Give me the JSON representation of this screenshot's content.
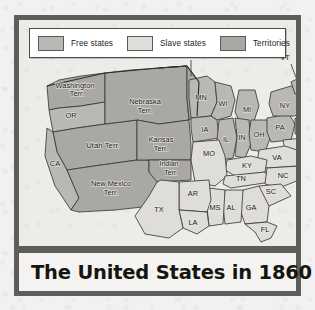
{
  "figure": {
    "title": "The United States in 1860",
    "legend": {
      "items": [
        {
          "label": "Free states",
          "color": "#b9b8b4",
          "key": "free"
        },
        {
          "label": "Slave states",
          "color": "#dedddA",
          "key": "slave"
        },
        {
          "label": "Territories",
          "color": "#a9a8a4",
          "key": "territory"
        }
      ]
    },
    "map": {
      "regions": [
        {
          "id": "washington-terr",
          "label": "Washington\nTerr.",
          "category": "territory"
        },
        {
          "id": "oregon",
          "label": "OR",
          "category": "free"
        },
        {
          "id": "california",
          "label": "CA",
          "category": "free"
        },
        {
          "id": "utah-terr",
          "label": "Utah Terr.",
          "category": "territory"
        },
        {
          "id": "new-mexico-terr",
          "label": "New Mexico\nTerr.",
          "category": "territory"
        },
        {
          "id": "nebraska-terr",
          "label": "Nebraska\nTerr.",
          "category": "territory"
        },
        {
          "id": "unorganized-terr",
          "label": "Unorganized\nTerr.",
          "category": "territory"
        },
        {
          "id": "kansas-terr",
          "label": "Kansas\nTerr.",
          "category": "territory"
        },
        {
          "id": "indian-terr",
          "label": "Indian\nTerr.",
          "category": "territory"
        },
        {
          "id": "minnesota",
          "label": "MN",
          "category": "free"
        },
        {
          "id": "wisconsin",
          "label": "WI",
          "category": "free"
        },
        {
          "id": "michigan",
          "label": "MI",
          "category": "free"
        },
        {
          "id": "iowa",
          "label": "IA",
          "category": "free"
        },
        {
          "id": "illinois",
          "label": "IL",
          "category": "free"
        },
        {
          "id": "indiana",
          "label": "IN",
          "category": "free"
        },
        {
          "id": "ohio",
          "label": "OH",
          "category": "free"
        },
        {
          "id": "pennsylvania",
          "label": "PA",
          "category": "free"
        },
        {
          "id": "new-york",
          "label": "NY",
          "category": "free"
        },
        {
          "id": "vermont",
          "label": "VT",
          "category": "free"
        },
        {
          "id": "new-hampshire",
          "label": "NH",
          "category": "free"
        },
        {
          "id": "maine",
          "label": "ME",
          "category": "free"
        },
        {
          "id": "massachusetts",
          "label": "MA",
          "category": "free"
        },
        {
          "id": "rhode-island",
          "label": "RI",
          "category": "free"
        },
        {
          "id": "connecticut",
          "label": "CT",
          "category": "free"
        },
        {
          "id": "new-jersey",
          "label": "NJ",
          "category": "free"
        },
        {
          "id": "delaware",
          "label": "DE",
          "category": "slave"
        },
        {
          "id": "maryland",
          "label": "MD",
          "category": "slave"
        },
        {
          "id": "virginia",
          "label": "VA",
          "category": "slave"
        },
        {
          "id": "north-carolina",
          "label": "NC",
          "category": "slave"
        },
        {
          "id": "south-carolina",
          "label": "SC",
          "category": "slave"
        },
        {
          "id": "georgia",
          "label": "GA",
          "category": "slave"
        },
        {
          "id": "florida",
          "label": "FL",
          "category": "slave"
        },
        {
          "id": "alabama",
          "label": "AL",
          "category": "slave"
        },
        {
          "id": "mississippi",
          "label": "MS",
          "category": "slave"
        },
        {
          "id": "tennessee",
          "label": "TN",
          "category": "slave"
        },
        {
          "id": "kentucky",
          "label": "KY",
          "category": "slave"
        },
        {
          "id": "missouri",
          "label": "MO",
          "category": "slave"
        },
        {
          "id": "arkansas",
          "label": "AR",
          "category": "slave"
        },
        {
          "id": "louisiana",
          "label": "LA",
          "category": "slave"
        },
        {
          "id": "texas",
          "label": "TX",
          "category": "slave"
        }
      ],
      "labels": {
        "washington_terr_1": "Washington",
        "washington_terr_2": "Terr.",
        "oregon": "OR",
        "california": "CA",
        "utah_terr": "Utah Terr.",
        "new_mexico_terr_1": "New Mexico",
        "new_mexico_terr_2": "Terr.",
        "nebraska_terr_1": "Nebraska",
        "nebraska_terr_2": "Terr.",
        "unorganized_terr_1": "Unorganized",
        "unorganized_terr_2": "Terr.",
        "kansas_terr_1": "Kansas",
        "kansas_terr_2": "Terr.",
        "indian_terr_1": "Indian",
        "indian_terr_2": "Terr.",
        "minnesota": "MN",
        "wisconsin": "WI",
        "michigan": "MI",
        "iowa": "IA",
        "illinois": "IL",
        "indiana": "IN",
        "ohio": "OH",
        "pennsylvania": "PA",
        "new_york": "NY",
        "vermont": "VT",
        "new_hampshire": "NH",
        "maine": "ME",
        "massachusetts": "MA",
        "rhode_island": "RI",
        "connecticut": "CT",
        "new_jersey": "NJ",
        "delaware": "DE",
        "maryland": "MD",
        "virginia": "VA",
        "north_carolina": "NC",
        "south_carolina": "SC",
        "georgia": "GA",
        "florida": "FL",
        "alabama": "AL",
        "mississippi": "MS",
        "tennessee": "TN",
        "kentucky": "KY",
        "missouri": "MO",
        "arkansas": "AR",
        "louisiana": "LA",
        "texas": "TX"
      }
    }
  }
}
